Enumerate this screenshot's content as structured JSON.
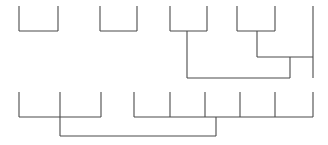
{
  "canvas": {
    "width": 328,
    "height": 145,
    "background": "#ffffff",
    "line_color": "#4a4a4a",
    "line_width": 1.1
  },
  "chart_data": {
    "type": "diagram",
    "subtype": "bracket-dendrogram",
    "title": "",
    "xlabel": "",
    "ylabel": "",
    "grid": false,
    "legend": null,
    "trees": [
      {
        "name": "top-tree",
        "baseline_y": 6,
        "leaf_count": 9,
        "leaves": [
          {
            "id": "t1",
            "x": 19,
            "y_top": 6,
            "y_bottom": 31
          },
          {
            "id": "t2",
            "x": 58,
            "y_top": 6,
            "y_bottom": 31
          },
          {
            "id": "t3",
            "x": 100,
            "y_top": 6,
            "y_bottom": 31
          },
          {
            "id": "t4",
            "x": 137,
            "y_top": 6,
            "y_bottom": 31
          },
          {
            "id": "t5",
            "x": 170,
            "y_top": 6,
            "y_bottom": 31
          },
          {
            "id": "t6",
            "x": 207,
            "y_top": 6,
            "y_bottom": 31
          },
          {
            "id": "t7",
            "x": 237,
            "y_top": 6,
            "y_bottom": 31
          },
          {
            "id": "t8",
            "x": 275,
            "y_top": 6,
            "y_bottom": 31
          },
          {
            "id": "t9",
            "x": 313,
            "y_top": 6,
            "y_bottom": 78
          }
        ],
        "connectors": [
          {
            "id": "tc1",
            "y": 31,
            "x_start": 19,
            "x_end": 58,
            "label": "pair-1-2"
          },
          {
            "id": "tc2",
            "y": 31,
            "x_start": 100,
            "x_end": 137,
            "label": "pair-3-4"
          },
          {
            "id": "tc3",
            "y": 31,
            "x_start": 170,
            "x_end": 207,
            "label": "pair-5-6"
          },
          {
            "id": "tc4",
            "y": 31,
            "x_start": 237,
            "x_end": 275,
            "label": "pair-7-8"
          },
          {
            "id": "tc5",
            "y": 57,
            "x_start": 257,
            "x_end": 313,
            "label": "node-78-with-9"
          },
          {
            "id": "tc6",
            "y": 78,
            "x_start": 187,
            "x_end": 290,
            "label": "node-56-with-789"
          }
        ],
        "stems": [
          {
            "id": "ts1",
            "x": 187,
            "y_top": 31,
            "y_bottom": 78,
            "label": "stem-pair-5-6"
          },
          {
            "id": "ts2",
            "x": 257,
            "y_top": 31,
            "y_bottom": 57,
            "label": "stem-pair-7-8"
          },
          {
            "id": "ts3",
            "x": 290,
            "y_top": 57,
            "y_bottom": 78,
            "label": "stem-node-789"
          }
        ]
      },
      {
        "name": "bottom-tree",
        "baseline_y": 92,
        "leaf_count": 9,
        "leaves": [
          {
            "id": "b1",
            "x": 19,
            "y_top": 92,
            "y_bottom": 117
          },
          {
            "id": "b2",
            "x": 60,
            "y_top": 92,
            "y_bottom": 136
          },
          {
            "id": "b3",
            "x": 101,
            "y_top": 92,
            "y_bottom": 117
          },
          {
            "id": "b4",
            "x": 134,
            "y_top": 92,
            "y_bottom": 117
          },
          {
            "id": "b5",
            "x": 170,
            "y_top": 92,
            "y_bottom": 117
          },
          {
            "id": "b6",
            "x": 205,
            "y_top": 92,
            "y_bottom": 117
          },
          {
            "id": "b7",
            "x": 240,
            "y_top": 92,
            "y_bottom": 117
          },
          {
            "id": "b8",
            "x": 275,
            "y_top": 92,
            "y_bottom": 117
          },
          {
            "id": "b9",
            "x": 313,
            "y_top": 92,
            "y_bottom": 117
          }
        ],
        "connectors": [
          {
            "id": "bc1",
            "y": 117,
            "x_start": 19,
            "x_end": 101,
            "label": "group-left"
          },
          {
            "id": "bc2",
            "y": 117,
            "x_start": 134,
            "x_end": 313,
            "label": "group-right"
          },
          {
            "id": "bc3",
            "y": 136,
            "x_start": 60,
            "x_end": 216,
            "label": "root-connector"
          }
        ],
        "stems": [
          {
            "id": "bs1",
            "x": 216,
            "y_top": 117,
            "y_bottom": 136,
            "label": "stem-group-right"
          }
        ]
      }
    ]
  }
}
